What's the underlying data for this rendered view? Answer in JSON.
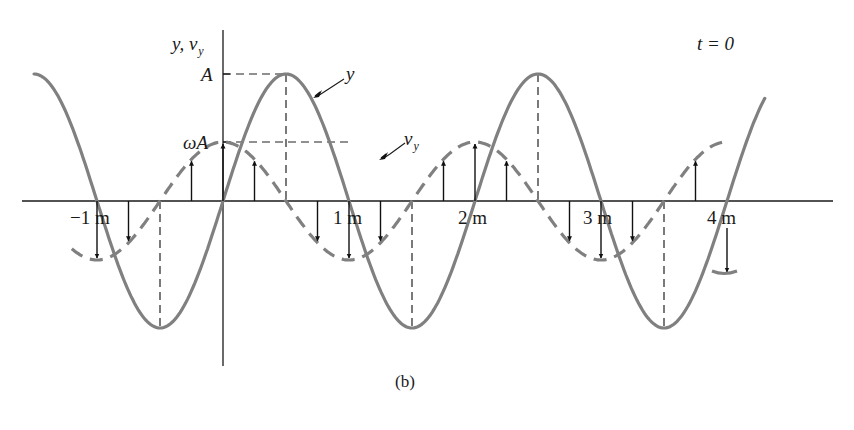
{
  "figure": {
    "caption": "(b)",
    "time_label": "t = 0",
    "y_axis_label": {
      "main": "y, v",
      "subscript": "y"
    },
    "y_ticks": [
      {
        "label": "A",
        "value": "A"
      },
      {
        "label": "ωA",
        "value": "omega*A"
      }
    ],
    "x_ticks": [
      "−1 m",
      "1 m",
      "2 m",
      "3 m",
      "4 m"
    ],
    "curve_labels": {
      "displacement": "y",
      "velocity": {
        "main": "v",
        "subscript": "y"
      }
    },
    "colors": {
      "curve": "#808080",
      "axis": "#1a1a1a",
      "arrow": "#111111",
      "guide": "#222222"
    }
  },
  "chart_data": {
    "type": "line",
    "title": "",
    "annotation": "t = 0",
    "xlabel": "x (m)",
    "ylabel": "y, v_y",
    "wavelength_m": 2,
    "x_tick_labels": [
      "−1 m",
      "1 m",
      "2 m",
      "3 m",
      "4 m"
    ],
    "x_tick_values": [
      -1,
      1,
      2,
      3,
      4
    ],
    "y_tick_labels": [
      "A",
      "ωA"
    ],
    "xlim": [
      -1.5,
      4.3
    ],
    "series": [
      {
        "name": "y",
        "style": "solid",
        "formula": "y = A sin(πx)",
        "x": [
          -1.5,
          -1.0,
          -0.5,
          0,
          0.5,
          1.0,
          1.5,
          2.0,
          2.5,
          3.0,
          3.5,
          4.0,
          4.3
        ],
        "values": [
          1,
          0,
          -1,
          0,
          1,
          0,
          -1,
          0,
          1,
          0,
          -1,
          0,
          0.81
        ]
      },
      {
        "name": "v_y",
        "style": "dashed",
        "formula": "v_y = ωA cos(πx)",
        "x": [
          -1.25,
          -1.0,
          -0.5,
          0,
          0.5,
          1.0,
          1.5,
          2.0,
          2.5,
          3.0,
          3.5,
          4.0
        ],
        "values": [
          0.71,
          1,
          0,
          -1,
          0,
          1,
          0,
          -1,
          0,
          1,
          0,
          -1
        ]
      }
    ],
    "velocity_arrows_x": [
      -1.0,
      -0.75,
      -0.25,
      0,
      0.25,
      0.75,
      1.0,
      1.25,
      1.75,
      2.0,
      2.25,
      2.75,
      3.0,
      3.25,
      3.75,
      4.0
    ],
    "guide_lines": [
      "horizontal dashed at y=A from axis to peak x=0.5",
      "horizontal dashed at y=ωA from axis to x=1.0",
      "vertical dashed at x=-0.5, 0.5, 1.5, 2.5, 3.5"
    ]
  }
}
